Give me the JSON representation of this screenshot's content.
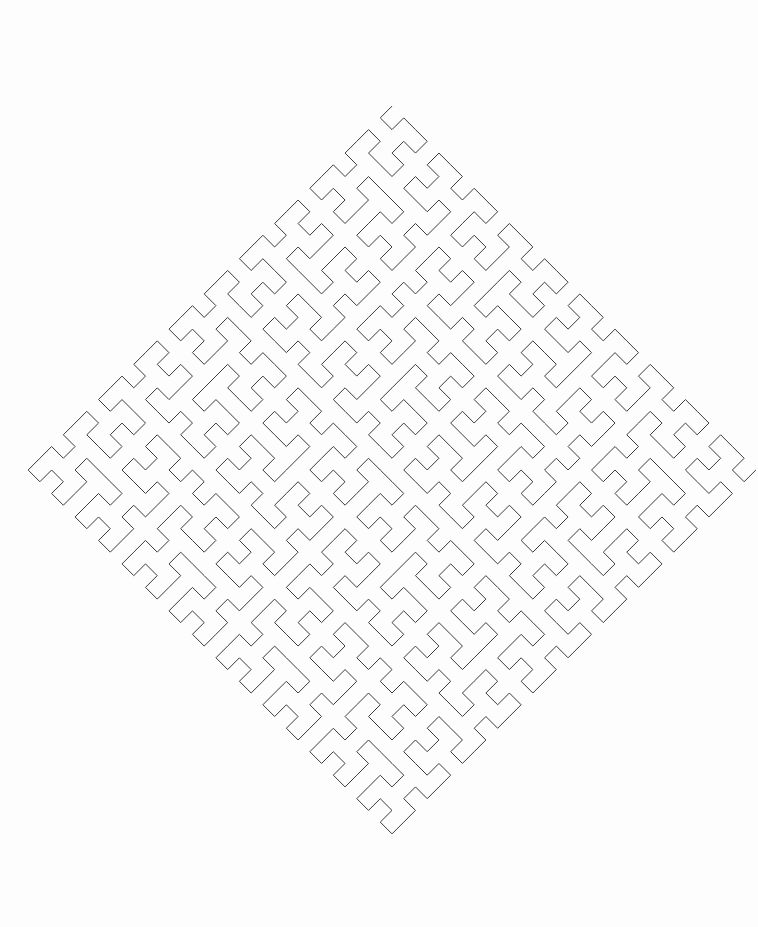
{
  "figure": {
    "type": "line-art",
    "canvas": {
      "width": 758,
      "height": 927,
      "background_color": "#fdfdfd"
    },
    "stroke": {
      "color": "#3a3a3c",
      "width": 1,
      "linejoin": "miter",
      "linecap": "butt",
      "fill": "none"
    },
    "geometry": {
      "curve_family": "hilbert",
      "order": 5,
      "grid_cells_per_side": 32,
      "rotation_degrees": 45,
      "cell_step": 16.6,
      "center_x": 392,
      "center_y": 470,
      "top_vertex": {
        "x": 322,
        "y": 62
      },
      "left_vertex": {
        "x": 38,
        "y": 345
      },
      "right_vertex": {
        "x": 748,
        "y": 370
      },
      "bottom_vertex": {
        "x": 432,
        "y": 880
      },
      "diamond_half_diagonal": 378
    }
  }
}
